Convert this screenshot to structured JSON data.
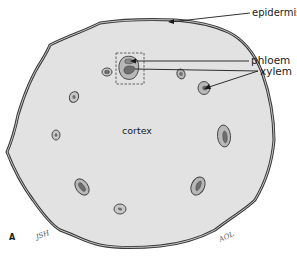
{
  "diagram": {
    "type": "plant stem cross-section",
    "figure_label": "A",
    "labels": {
      "epidermis": "epidermis",
      "phloem": "phloem",
      "xylem": "xylem",
      "cortex": "cortex"
    },
    "signatures": {
      "left": "JSH",
      "right": "AOL"
    },
    "colors": {
      "cortex_fill": "#e2e2e2",
      "bundle_fill": "#b8b8b8",
      "xylem_fill": "#6e6e6e",
      "outline": "#3a3a3a",
      "background": "#ffffff"
    },
    "vascular_bundles": [
      {
        "id": "highlighted",
        "cx": 128,
        "cy": 68,
        "highlighted": true
      },
      {
        "id": "b1",
        "cx": 107,
        "cy": 72
      },
      {
        "id": "b2",
        "cx": 181,
        "cy": 74
      },
      {
        "id": "b3",
        "cx": 204,
        "cy": 88
      },
      {
        "id": "b4",
        "cx": 74,
        "cy": 97
      },
      {
        "id": "b5",
        "cx": 56,
        "cy": 135
      },
      {
        "id": "b6",
        "cx": 224,
        "cy": 136
      },
      {
        "id": "b7",
        "cx": 82,
        "cy": 187
      },
      {
        "id": "b8",
        "cx": 198,
        "cy": 186
      },
      {
        "id": "b9",
        "cx": 120,
        "cy": 209
      }
    ]
  }
}
